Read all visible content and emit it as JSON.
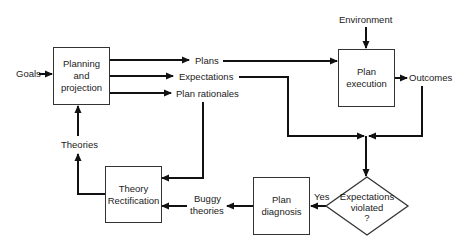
{
  "diagram": {
    "inputs": {
      "goals": "Goals",
      "environment": "Environment"
    },
    "nodes": {
      "planning": [
        "Planning",
        "and",
        "projection"
      ],
      "execution": [
        "Plan",
        "execution"
      ],
      "diagnosis": [
        "Plan",
        "diagnosis"
      ],
      "rectification": [
        "Theory",
        "Rectification"
      ],
      "decision": [
        "Expectations",
        "violated",
        "?"
      ]
    },
    "edge_labels": {
      "plans": "Plans",
      "expectations": "Expectations",
      "plan_rationales": "Plan rationales",
      "outcomes": "Outcomes",
      "theories": "Theories",
      "buggy_theories_1": "Buggy",
      "buggy_theories_2": "theories",
      "yes": "Yes"
    },
    "colors": {
      "line": "#111111",
      "box_border": "#333333",
      "background": "#ffffff"
    }
  }
}
